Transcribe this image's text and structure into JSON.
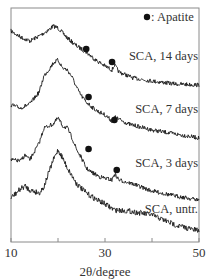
{
  "chart_data": {
    "type": "line",
    "title": "",
    "xlabel": "2θ/degree",
    "ylabel": "",
    "xlim": [
      10,
      50
    ],
    "xticks": [
      10,
      20,
      30,
      40,
      50
    ],
    "xtick_labels": [
      "10",
      "",
      "30",
      "",
      "50"
    ],
    "grid": false,
    "y_units": "arbitrary intensity (stacked, offset)",
    "legend": {
      "marker": "●",
      "label": ": Apatite",
      "position": "top-right"
    },
    "series": [
      {
        "name": "SCA, 14 days",
        "label_pos": [
          200,
          60
        ],
        "points": [
          [
            10,
            31
          ],
          [
            12,
            37
          ],
          [
            14,
            41
          ],
          [
            16,
            36
          ],
          [
            18,
            30
          ],
          [
            19,
            26
          ],
          [
            20,
            28
          ],
          [
            21,
            33
          ],
          [
            22,
            38
          ],
          [
            24,
            46
          ],
          [
            26,
            52
          ],
          [
            27,
            56
          ],
          [
            28,
            60
          ],
          [
            30,
            66
          ],
          [
            31.5,
            70
          ],
          [
            32,
            65
          ],
          [
            33,
            72
          ],
          [
            36,
            78
          ],
          [
            40,
            81
          ],
          [
            45,
            84
          ],
          [
            50,
            85
          ]
        ],
        "apatite_peaks": [
          26,
          31.5
        ]
      },
      {
        "name": "SCA, 7 days",
        "label_pos": [
          200,
          113
        ],
        "points": [
          [
            10,
            105
          ],
          [
            12,
            108
          ],
          [
            14,
            104
          ],
          [
            16,
            92
          ],
          [
            17,
            76
          ],
          [
            18,
            70
          ],
          [
            19,
            63
          ],
          [
            20,
            60
          ],
          [
            21,
            68
          ],
          [
            22,
            70
          ],
          [
            23,
            77
          ],
          [
            24,
            88
          ],
          [
            25,
            96
          ],
          [
            26,
            102
          ],
          [
            28,
            110
          ],
          [
            30,
            115
          ],
          [
            31.5,
            121
          ],
          [
            32,
            117
          ],
          [
            35,
            124
          ],
          [
            40,
            130
          ],
          [
            45,
            134
          ],
          [
            50,
            138
          ]
        ],
        "apatite_peaks": [
          26,
          31.5
        ]
      },
      {
        "name": "SCA, 3 days",
        "label_pos": [
          200,
          167
        ],
        "points": [
          [
            10,
            160
          ],
          [
            12,
            161
          ],
          [
            13,
            155
          ],
          [
            14,
            160
          ],
          [
            16,
            143
          ],
          [
            17,
            128
          ],
          [
            18,
            126
          ],
          [
            19,
            124
          ],
          [
            20,
            118
          ],
          [
            21,
            126
          ],
          [
            22,
            128
          ],
          [
            23,
            138
          ],
          [
            24,
            150
          ],
          [
            25,
            158
          ],
          [
            26,
            168
          ],
          [
            27,
            172
          ],
          [
            29,
            177
          ],
          [
            31.5,
            180
          ],
          [
            32,
            174
          ],
          [
            33,
            180
          ],
          [
            36,
            184
          ],
          [
            40,
            191
          ],
          [
            45,
            196
          ],
          [
            50,
            200
          ]
        ],
        "apatite_peaks": [
          26,
          32
        ]
      },
      {
        "name": "SCA, untr.",
        "label_pos": [
          200,
          213
        ],
        "points": [
          [
            10,
            198
          ],
          [
            12,
            189
          ],
          [
            13,
            186
          ],
          [
            14,
            190
          ],
          [
            16,
            193
          ],
          [
            17,
            187
          ],
          [
            18,
            173
          ],
          [
            19,
            160
          ],
          [
            20,
            150
          ],
          [
            21,
            158
          ],
          [
            22,
            168
          ],
          [
            24,
            184
          ],
          [
            26,
            193
          ],
          [
            28,
            199
          ],
          [
            30,
            204
          ],
          [
            32,
            210
          ],
          [
            35,
            211
          ],
          [
            40,
            215
          ],
          [
            45,
            225
          ],
          [
            50,
            231
          ]
        ],
        "apatite_peaks": []
      }
    ],
    "annotations": [
      {
        "text": "●",
        "note": "apatite marker",
        "series": "SCA, 14 days",
        "x": 26,
        "y_px": 49
      },
      {
        "text": "●",
        "note": "apatite marker",
        "series": "SCA, 14 days",
        "x": 31.5,
        "y_px": 62
      },
      {
        "text": "●",
        "note": "apatite marker",
        "series": "SCA, 7 days",
        "x": 26.5,
        "y_px": 97
      },
      {
        "text": "●",
        "note": "apatite marker",
        "series": "SCA, 7 days",
        "x": 32,
        "y_px": 120
      },
      {
        "text": "●",
        "note": "apatite marker",
        "series": "SCA, 3 days",
        "x": 26.5,
        "y_px": 149
      },
      {
        "text": "●",
        "note": "apatite marker",
        "series": "SCA, 3 days",
        "x": 32.5,
        "y_px": 170
      }
    ]
  },
  "colors": {
    "trace": "#1a1a1a",
    "axis": "#888888",
    "text": "#333333",
    "background": "#ffffff"
  }
}
